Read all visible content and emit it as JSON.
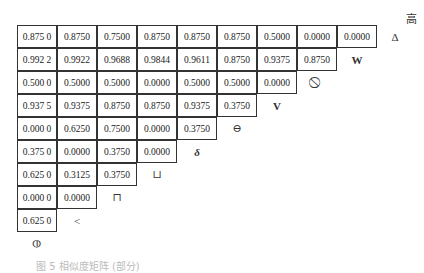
{
  "corner_label": "高",
  "rows": [
    {
      "values": [
        "0.875 0",
        "0.8750",
        "0.7500",
        "0.8750",
        "0.8750",
        "0.8750",
        "0.5000",
        "0.0000",
        "0.0000"
      ],
      "symbol": "Δ"
    },
    {
      "values": [
        "0.992 2",
        "0.9922",
        "0.9688",
        "0.9844",
        "0.9611",
        "0.8750",
        "0.9375",
        "0.8750"
      ],
      "symbol": "W"
    },
    {
      "values": [
        "0.500 0",
        "0.5000",
        "0.5000",
        "0.0000",
        "0.5000",
        "0.5000",
        "0.0000"
      ],
      "symbol": "⃠"
    },
    {
      "values": [
        "0.937 5",
        "0.9375",
        "0.8750",
        "0.8750",
        "0.9375",
        "0.3750"
      ],
      "symbol": "V"
    },
    {
      "values": [
        "0.000 0",
        "0.6250",
        "0.7500",
        "0.0000",
        "0.3750"
      ],
      "symbol": "⊖"
    },
    {
      "values": [
        "0.375 0",
        "0.0000",
        "0.3750",
        "0.0000"
      ],
      "symbol": "δ"
    },
    {
      "values": [
        "0.625 0",
        "0.3125",
        "0.3750"
      ],
      "symbol": "⊔"
    },
    {
      "values": [
        "0.000 0",
        "0.0000"
      ],
      "symbol": "⊓"
    },
    {
      "values": [
        "0.625 0"
      ],
      "symbol": "<"
    },
    {
      "values": [],
      "symbol": "⦶"
    }
  ],
  "caption": "图 5  相似度矩阵 (部分)"
}
